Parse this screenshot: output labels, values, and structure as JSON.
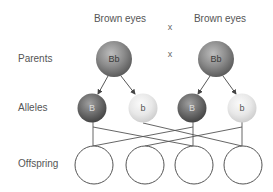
{
  "diagram": {
    "phenotypes": [
      "Brown eyes",
      "Brown eyes"
    ],
    "cross_symbols": [
      "x",
      "x"
    ],
    "row_labels": {
      "parents": "Parents",
      "alleles": "Alleles",
      "offspring": "Offspring"
    },
    "parents": [
      {
        "genotype": "Bb"
      },
      {
        "genotype": "Bb"
      }
    ],
    "alleles": [
      {
        "label": "B",
        "type": "dominant"
      },
      {
        "label": "b",
        "type": "recessive"
      },
      {
        "label": "B",
        "type": "dominant"
      },
      {
        "label": "b",
        "type": "recessive"
      }
    ],
    "offspring_count": 4,
    "colors": {
      "parent_sphere": "#8a8a8a",
      "dominant_allele": "#6e6e6e",
      "recessive_allele": "#e6e6e6",
      "lines": "#555555",
      "offspring_outline": "#555555"
    }
  }
}
